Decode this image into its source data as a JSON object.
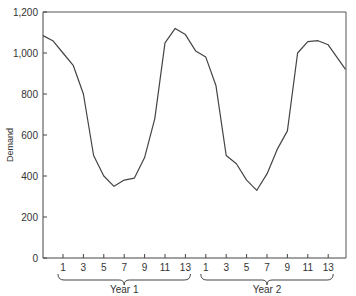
{
  "chart_data": {
    "type": "line",
    "title": "",
    "xlabel": "",
    "ylabel": "Demand",
    "ylim": [
      0,
      1200
    ],
    "grid": false,
    "legend": null,
    "y_ticks": [
      {
        "value": 0,
        "label": "0"
      },
      {
        "value": 200,
        "label": "200"
      },
      {
        "value": 400,
        "label": "400"
      },
      {
        "value": 600,
        "label": "600"
      },
      {
        "value": 800,
        "label": "800"
      },
      {
        "value": 1000,
        "label": "1,000"
      },
      {
        "value": 1200,
        "label": "1,200"
      }
    ],
    "x_groups": [
      {
        "label": "Year 1",
        "tick_labels": [
          "1",
          "3",
          "5",
          "7",
          "9",
          "11",
          "13"
        ]
      },
      {
        "label": "Year 2",
        "tick_labels": [
          "1",
          "3",
          "5",
          "7",
          "9",
          "11",
          "13"
        ]
      }
    ],
    "x_tick_labels": [
      "1",
      "3",
      "5",
      "7",
      "9",
      "11",
      "13",
      "1",
      "3",
      "5",
      "7",
      "9",
      "11",
      "13"
    ],
    "series": [
      {
        "name": "Demand",
        "x": [
          -1,
          0,
          1,
          2,
          3,
          4,
          5,
          6,
          7,
          8,
          9,
          10,
          11,
          12,
          13,
          14,
          15,
          16,
          17,
          18,
          19,
          20,
          21,
          22,
          23,
          24,
          25,
          26,
          27,
          28.7
        ],
        "x_description": "periods indexed continuously; Year 1 periods 1-13 = x 1..13, Year 2 periods 1-13 = x 15..27",
        "values": [
          1085,
          1060,
          1000,
          940,
          800,
          500,
          400,
          350,
          380,
          390,
          490,
          680,
          1050,
          1120,
          1090,
          1010,
          980,
          840,
          500,
          460,
          380,
          330,
          410,
          530,
          620,
          1000,
          1055,
          1060,
          1040,
          920
        ]
      }
    ]
  }
}
